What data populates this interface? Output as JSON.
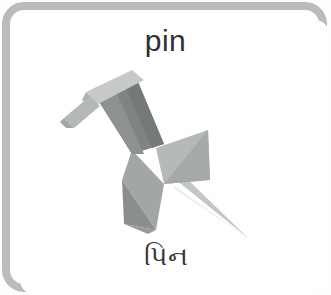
{
  "card": {
    "word_en": "pin",
    "word_translation": "પિન",
    "illustration": {
      "icon_name": "pushpin-illustration",
      "description": "grayscale 3D pushpin tilted diagonally, cap at upper-left, needle pointing to lower-right"
    }
  },
  "colors": {
    "border": "#b9bcbd",
    "card_background": "#ffffff",
    "text": "#2f3133",
    "pin_cap_light": "#c9cbcc",
    "pin_cap_mid": "#b0b3b4",
    "pin_body_dark": "#7d8081",
    "pin_body_mid": "#8f9293",
    "pin_skirt_light": "#b6b9ba",
    "pin_skirt_mid": "#a0a3a4",
    "pin_skirt_dark": "#86898a",
    "pin_needle": "#d6d8d9",
    "pin_shadow": "#e6e8e9"
  }
}
